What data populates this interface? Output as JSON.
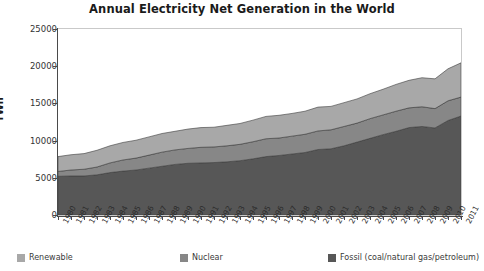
{
  "chart_data": {
    "type": "area",
    "stacked": true,
    "title": "Annual Electricity Net Generation in the World",
    "xlabel": "",
    "ylabel": "TWh",
    "ylim": [
      0,
      25000
    ],
    "yticks": [
      0,
      5000,
      10000,
      15000,
      20000,
      25000
    ],
    "grid": false,
    "legend_position": "bottom",
    "categories": [
      "1980",
      "1981",
      "1982",
      "1983",
      "1984",
      "1985",
      "1986",
      "1987",
      "1988",
      "1989",
      "1990",
      "1991",
      "1992",
      "1993",
      "1994",
      "1995",
      "1996",
      "1997",
      "1998",
      "1999",
      "2000",
      "2001",
      "2002",
      "2003",
      "2004",
      "2005",
      "2006",
      "2007",
      "2008",
      "2009",
      "2010",
      "2011"
    ],
    "series": [
      {
        "name": "Fossil (coal/natural gas/petroleum)",
        "color": "#575757",
        "values": [
          5200,
          5250,
          5250,
          5400,
          5700,
          5900,
          6050,
          6300,
          6550,
          6800,
          6950,
          7000,
          7050,
          7150,
          7300,
          7550,
          7850,
          8000,
          8200,
          8400,
          8800,
          8900,
          9300,
          9800,
          10300,
          10800,
          11250,
          11750,
          11900,
          11700,
          12700,
          13300
        ]
      },
      {
        "name": "Nuclear",
        "color": "#878787",
        "values": [
          650,
          800,
          900,
          1050,
          1300,
          1500,
          1600,
          1750,
          1900,
          1950,
          2000,
          2100,
          2100,
          2150,
          2200,
          2300,
          2400,
          2350,
          2400,
          2450,
          2500,
          2550,
          2600,
          2550,
          2650,
          2650,
          2700,
          2650,
          2650,
          2600,
          2650,
          2550
        ]
      },
      {
        "name": "Renewable",
        "color": "#a8a8a8",
        "values": [
          2000,
          2050,
          2100,
          2250,
          2300,
          2350,
          2400,
          2450,
          2500,
          2500,
          2600,
          2650,
          2650,
          2750,
          2800,
          2900,
          3000,
          3050,
          3050,
          3100,
          3200,
          3150,
          3200,
          3250,
          3350,
          3450,
          3600,
          3700,
          3900,
          4000,
          4300,
          4600
        ]
      }
    ],
    "legend": [
      {
        "label": "Renewable",
        "color": "#a8a8a8"
      },
      {
        "label": "Nuclear",
        "color": "#878787"
      },
      {
        "label": "Fossil (coal/natural gas/petroleum)",
        "color": "#575757"
      }
    ]
  }
}
